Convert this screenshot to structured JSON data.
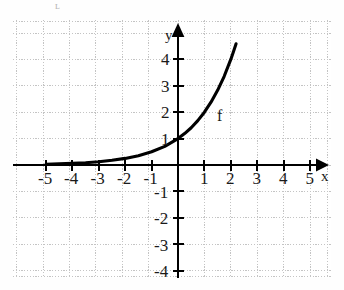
{
  "artifact": {
    "text": "ʟ"
  },
  "chart_data": {
    "type": "line",
    "title": "",
    "subtitle": "",
    "xlabel": "x",
    "ylabel": "y",
    "xlim": [
      -5.9,
      5.9
    ],
    "ylim": [
      -4.9,
      4.7
    ],
    "grid": true,
    "grid_color": "#c9c9c9",
    "axis_color": "#000000",
    "curve_color": "#000000",
    "legend": "none",
    "x_ticks": [
      -5,
      -4,
      -3,
      -2,
      -1,
      1,
      2,
      3,
      4,
      5
    ],
    "x_tick_labels": [
      "-5",
      "-4",
      "-3",
      "-2",
      "-1",
      "1",
      "2",
      "3",
      "4",
      "5"
    ],
    "y_ticks": [
      4,
      3,
      2,
      1,
      -1,
      -2,
      -3,
      -4
    ],
    "y_tick_labels": [
      "4",
      "3",
      "2",
      "1",
      "-1",
      "-2",
      "-3",
      "-4"
    ],
    "annotations": [
      {
        "text": "f",
        "x": 1.55,
        "y": 1.5
      }
    ],
    "series": [
      {
        "name": "f",
        "label": "f",
        "equation": "f(x) = 2^x",
        "x": [
          -5,
          -4.5,
          -4,
          -3.5,
          -3,
          -2.5,
          -2,
          -1.5,
          -1,
          -0.5,
          0,
          0.25,
          0.5,
          0.75,
          1,
          1.25,
          1.5,
          1.75,
          2,
          2.1,
          2.2
        ],
        "values": [
          0.031,
          0.044,
          0.063,
          0.088,
          0.125,
          0.177,
          0.25,
          0.354,
          0.5,
          0.707,
          1.0,
          1.19,
          1.41,
          1.68,
          2.0,
          2.38,
          2.83,
          3.36,
          4.0,
          4.29,
          4.59
        ]
      }
    ]
  }
}
